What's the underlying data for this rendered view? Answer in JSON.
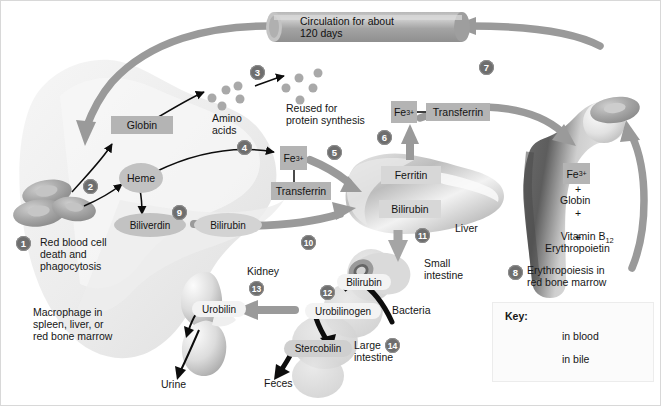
{
  "diagram": {
    "colors": {
      "arrow_blood": "#9a9a9a",
      "arrow_bile": "#a5a5a5",
      "chip_gray": "#b4b4b4",
      "bullet": "#6e6e6e",
      "background": "#ffffff",
      "macrophage": "#eeeeee",
      "liver": "#d0d0d0",
      "bone": "#cfcfcf"
    },
    "circulation": {
      "line1": "Circulation for about",
      "line2": "120 days"
    },
    "steps": [
      {
        "n": "1",
        "label": "Red blood cell\ndeath and\nphagocytosis"
      },
      {
        "n": "2",
        "label": ""
      },
      {
        "n": "3",
        "label": ""
      },
      {
        "n": "4",
        "label": ""
      },
      {
        "n": "5",
        "label": ""
      },
      {
        "n": "6",
        "label": ""
      },
      {
        "n": "7",
        "label": ""
      },
      {
        "n": "8",
        "label": "Erythropoiesis in\nred bone marrow"
      },
      {
        "n": "9",
        "label": ""
      },
      {
        "n": "10",
        "label": ""
      },
      {
        "n": "11",
        "label": ""
      },
      {
        "n": "12",
        "label": ""
      },
      {
        "n": "13",
        "label": ""
      },
      {
        "n": "14",
        "label": ""
      }
    ],
    "step_numbers": {
      "n1": "1",
      "n2": "2",
      "n3": "3",
      "n4": "4",
      "n5": "5",
      "n6": "6",
      "n7": "7",
      "n8": "8",
      "n9": "9",
      "n10": "10",
      "n11": "11",
      "n12": "12",
      "n13": "13",
      "n14": "14"
    },
    "labels": {
      "globin": "Globin",
      "heme": "Heme",
      "amino_acids_l1": "Amino",
      "amino_acids_l2": "acids",
      "reused_l1": "Reused for",
      "reused_l2": "protein synthesis",
      "fe_left": "Fe",
      "fe_left_sup": "3+",
      "transferrin_left": "Transferrin",
      "fe_top": "Fe",
      "fe_top_sup": "3+",
      "transferrin_top": "Transferrin",
      "transferrin_dash": "—",
      "ferritin": "Ferritin",
      "bilirubin_liver": "Bilirubin",
      "liver": "Liver",
      "biliverdin": "Biliverdin",
      "bilirubin_macrophage": "Bilirubin",
      "rbc_death_l1": "Red blood cell",
      "rbc_death_l2": "death and",
      "rbc_death_l3": "phagocytosis",
      "macrophage_l1": "Macrophage in",
      "macrophage_l2": "spleen, liver, or",
      "macrophage_l3": "red bone marrow",
      "small_intestine_l1": "Small",
      "small_intestine_l2": "intestine",
      "bilirubin_intestine": "Bilirubin",
      "bacteria": "Bacteria",
      "urobilinogen": "Urobilinogen",
      "stercobilin": "Stercobilin",
      "feces": "Feces",
      "large_intestine_l1": "Large",
      "large_intestine_l2": "intestine",
      "kidney": "Kidney",
      "urobilin": "Urobilin",
      "urine": "Urine",
      "marrow_fe": "Fe",
      "marrow_fe_sup": "3+",
      "plus1": "+",
      "marrow_globin": "Globin",
      "plus2": "+",
      "marrow_vitamin": "Vitamin B",
      "marrow_vitamin_sub": "12",
      "plus3": "+",
      "marrow_epo": "Erythropoietin",
      "erythropoiesis_l1": "Erythropoiesis in",
      "erythropoiesis_l2": "red bone marrow"
    },
    "key": {
      "title": "Key:",
      "items": [
        {
          "label": "in blood",
          "color": "#9a9a9a"
        },
        {
          "label": "in bile",
          "color": "#a5a5a5"
        }
      ],
      "item0_label": "in blood",
      "item1_label": "in bile"
    }
  }
}
